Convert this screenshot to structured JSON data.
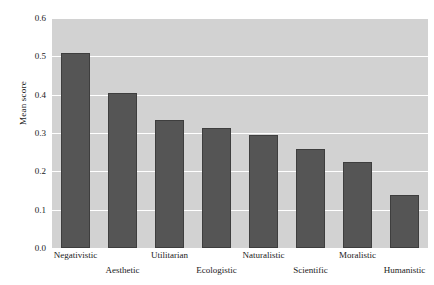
{
  "chart_data": {
    "type": "bar",
    "title": "",
    "subtitle": "",
    "xlabel": "",
    "ylabel": "Mean score",
    "categories": [
      "Negativistic",
      "Aesthetic",
      "Utilitarian",
      "Ecologistic",
      "Naturalistic",
      "Scientific",
      "Moralistic",
      "Humanistic"
    ],
    "values": [
      0.51,
      0.405,
      0.335,
      0.313,
      0.295,
      0.258,
      0.225,
      0.138
    ],
    "series": [
      {
        "name": "Mean score",
        "values": [
          0.51,
          0.405,
          0.335,
          0.313,
          0.295,
          0.258,
          0.225,
          0.138
        ]
      }
    ],
    "ylim": [
      0.0,
      0.6
    ],
    "ytick_labels": [
      "0.0",
      "0.1",
      "0.2",
      "0.3",
      "0.4",
      "0.5",
      "0.6"
    ],
    "ytick_values": [
      0.0,
      0.1,
      0.2,
      0.3,
      0.4,
      0.5,
      0.6
    ],
    "grid": true,
    "grid_axis": "y",
    "grid_color": "#ffffff",
    "legend": false,
    "legend_position": "none",
    "plot_background": "#d2d2d2",
    "bar_color": "#555555",
    "bar_edge_color": "#3e3e3e",
    "figure_background": "#ffffff",
    "xtick_label_rows": [
      0,
      1,
      0,
      1,
      0,
      1,
      0,
      1
    ],
    "annotations": []
  }
}
